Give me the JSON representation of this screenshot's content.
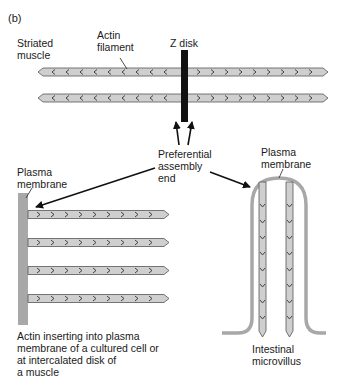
{
  "panel_label": "(b)",
  "labels": {
    "striated_muscle": "Striated\nmuscle",
    "actin_filament": "Actin\nfilament",
    "z_disk": "Z disk",
    "preferential_assembly_end": "Preferential\nassembly\nend",
    "plasma_membrane_left": "Plasma\nmembrane",
    "plasma_membrane_right": "Plasma\nmembrane",
    "caption_left": "Actin inserting into plasma\nmembrane of a cultured cell or\nat intercalated disk of\na muscle",
    "caption_right": "Intestinal\nmicrovillus"
  },
  "colors": {
    "filament_fill": "#cfcfcf",
    "filament_stroke": "#555555",
    "membrane": "#a8a8a8",
    "z_disk": "#111111",
    "arrow": "#111111"
  }
}
